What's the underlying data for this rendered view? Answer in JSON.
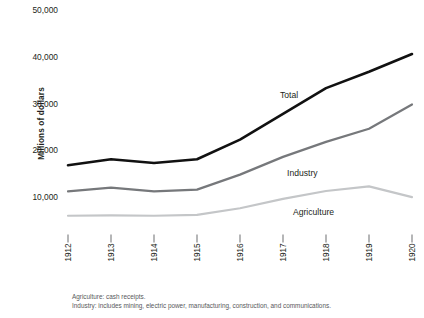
{
  "chart_data": {
    "type": "line",
    "title": "",
    "subtitle": "",
    "xlabel": "",
    "ylabel": "Millions of dollars",
    "x": [
      1912,
      1913,
      1914,
      1915,
      1916,
      1917,
      1918,
      1919,
      1920
    ],
    "categories": [
      "1912",
      "1913",
      "1914",
      "1915",
      "1916",
      "1917",
      "1918",
      "1919",
      "1920"
    ],
    "xlim": [
      1912,
      1920
    ],
    "ylim": [
      0,
      50000
    ],
    "yticks": [
      10000,
      20000,
      30000,
      40000,
      50000
    ],
    "ytick_labels": [
      "10,000",
      "20,000",
      "30,000",
      "40,000",
      "50,000"
    ],
    "grid": false,
    "legend_position": "inline-annotations",
    "series": [
      {
        "name": "Total",
        "color": "#111111",
        "width": 2.6,
        "values": [
          17000,
          18300,
          17500,
          18300,
          22500,
          28000,
          33500,
          37000,
          40800
        ]
      },
      {
        "name": "Industry",
        "color": "#76787b",
        "width": 2.2,
        "values": [
          11400,
          12200,
          11400,
          11800,
          15000,
          18800,
          22000,
          24800,
          30000
        ]
      },
      {
        "name": "Agriculture",
        "color": "#c4c6c8",
        "width": 2.2,
        "values": [
          6200,
          6300,
          6200,
          6400,
          7800,
          9800,
          11500,
          12500,
          10200
        ]
      }
    ],
    "annotations": [
      {
        "text": "Total",
        "series": "Total",
        "x_px": 280,
        "y_px": 90
      },
      {
        "text": "Industry",
        "series": "Industry",
        "x_px": 287,
        "y_px": 168
      },
      {
        "text": "Agriculture",
        "series": "Agriculture",
        "x_px": 293,
        "y_px": 207
      }
    ]
  },
  "footnotes": [
    "Agriculture: cash receipts.",
    "Industry: includes mining, electric power, manufacturing, construction, and communications."
  ]
}
